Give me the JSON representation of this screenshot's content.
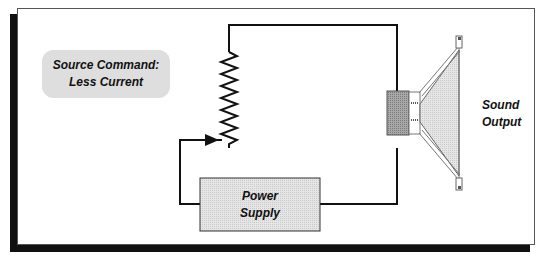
{
  "diagram": {
    "command_box": {
      "line1": "Source Command:",
      "line2": "Less Current"
    },
    "power_supply": {
      "line1": "Power",
      "line2": "Supply"
    },
    "speaker": {
      "line1": "Sound",
      "line2": "Output"
    },
    "components": [
      "variable-resistor",
      "power-supply",
      "speaker"
    ],
    "colors": {
      "shadow": "#111111",
      "box_fill": "#dedede",
      "magnet_fill": "#9a9a9a",
      "cone_fill": "#e4e4e4",
      "wire": "#111111"
    }
  }
}
